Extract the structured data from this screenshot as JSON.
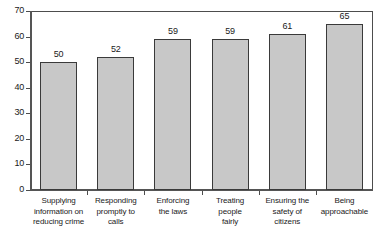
{
  "chart_data": {
    "type": "bar",
    "title": "",
    "subtitle": "",
    "xlabel": "",
    "ylabel": "",
    "ylim": [
      0,
      70
    ],
    "ytick_step": 10,
    "yticks": [
      0,
      10,
      20,
      30,
      40,
      50,
      60,
      70
    ],
    "grid": false,
    "legend": null,
    "orientation": "vertical",
    "categories": [
      "Supplying\ninformation on\nreducing crime",
      "Responding\npromptly to\ncalls",
      "Enforcing\nthe laws",
      "Treating\npeople\nfairly",
      "Ensuring the\nsafety of\ncitizens",
      "Being\napproachable"
    ],
    "values": [
      50,
      52,
      59,
      59,
      61,
      65
    ],
    "value_labels": [
      "50",
      "52",
      "59",
      "59",
      "61",
      "65"
    ],
    "bar_color": "#c8c8c8",
    "bar_border_color": "#3a3a3a",
    "axis_color": "#4d4d4d",
    "text_color": "#1a1a1a",
    "background": "#ffffff"
  }
}
